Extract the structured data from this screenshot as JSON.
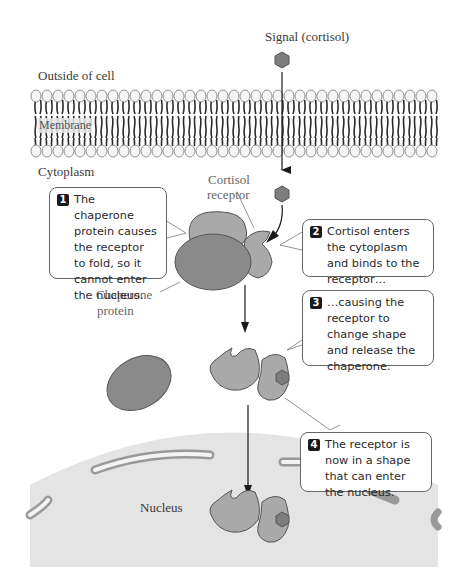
{
  "labels": {
    "signal": "Signal (cortisol)",
    "outside": "Outside of cell",
    "membrane": "Membrane",
    "cytoplasm": "Cytoplasm",
    "cortisol_receptor_line1": "Cortisol",
    "cortisol_receptor_line2": "receptor",
    "chaperone_line1": "Chaperone",
    "chaperone_line2": "protein",
    "nucleus": "Nucleus"
  },
  "steps": [
    {
      "number": "1",
      "text": "The chaperone protein causes the receptor to fold, so it cannot enter the nucleus."
    },
    {
      "number": "2",
      "text": "Cortisol enters the cytoplasm and binds to the receptor…"
    },
    {
      "number": "3",
      "text": "…causing the receptor to change shape and release the chaperone."
    },
    {
      "number": "4",
      "text": "The receptor is now in a shape that can enter the nucleus."
    }
  ],
  "colors": {
    "chaperone": "#8a8a8a",
    "receptor": "#a9a9a9",
    "cortisol": "#7d7d7d",
    "nucleus": "#e4e4e4",
    "membrane_head": "#f4f4f4",
    "outline": "#555555"
  }
}
